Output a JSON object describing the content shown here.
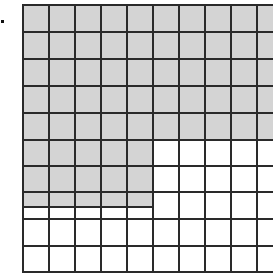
{
  "figure": {
    "type": "hundredths-grid",
    "rows": 10,
    "cols": 10,
    "shaded_color": "#d4d4d4",
    "unshaded_color": "#ffffff",
    "line_color": "#2a2a2a",
    "shaded_full_rows": 5,
    "shaded_partial_rows": [
      {
        "row": 5,
        "cols": 5
      },
      {
        "row": 6,
        "cols": 5
      },
      {
        "row": 7,
        "cols": 5,
        "fraction_of_row_height": 0.57
      }
    ],
    "marker": "dot"
  }
}
